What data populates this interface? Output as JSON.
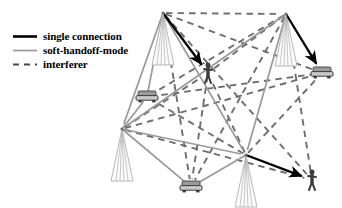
{
  "figure": {
    "background_color": "#ffffff"
  },
  "colors": {
    "single_connection": "#000000",
    "soft_handoff": "#9a9a9a",
    "interferer": "#6e6e6e",
    "tower_outline": "#b0b0b0",
    "mobile_fill": "#5a5a5a",
    "text": "#000000"
  },
  "legend": {
    "items": [
      {
        "label": "single connection",
        "style": "solid-thick",
        "color": "#000000",
        "icon": "solid-line-icon"
      },
      {
        "label": "soft-handoff-mode",
        "style": "solid-thin",
        "color": "#9a9a9a",
        "icon": "solid-line-icon"
      },
      {
        "label": "interferer",
        "style": "dashed",
        "color": "#6e6e6e",
        "icon": "dashed-line-icon"
      }
    ]
  },
  "diagram": {
    "base_stations": [
      {
        "id": "bs-top-left",
        "x": 163,
        "y": 13,
        "name": "base-station-top-left"
      },
      {
        "id": "bs-top-right",
        "x": 286,
        "y": 14,
        "name": "base-station-top-right"
      },
      {
        "id": "bs-left",
        "x": 122,
        "y": 129,
        "name": "base-station-left"
      },
      {
        "id": "bs-bottom",
        "x": 246,
        "y": 155,
        "name": "base-station-bottom"
      }
    ],
    "mobiles": [
      {
        "id": "ms-car-left",
        "x": 147,
        "y": 97,
        "type": "car",
        "name": "mobile-car-left"
      },
      {
        "id": "ms-ped-center",
        "x": 208,
        "y": 73,
        "type": "pedestrian",
        "name": "mobile-pedestrian-center"
      },
      {
        "id": "ms-car-right",
        "x": 322,
        "y": 73,
        "type": "car",
        "name": "mobile-car-right"
      },
      {
        "id": "ms-car-bottom",
        "x": 191,
        "y": 187,
        "type": "car",
        "name": "mobile-car-bottom"
      },
      {
        "id": "ms-ped-bottomright",
        "x": 312,
        "y": 180,
        "type": "pedestrian",
        "name": "mobile-pedestrian-bottom-right"
      }
    ],
    "single_connections": [
      {
        "from": "bs-top-right",
        "to": "ms-car-right",
        "arrow": true
      },
      {
        "from": "bs-bottom",
        "to": "ms-ped-bottomright",
        "arrow": true
      },
      {
        "from": "bs-top-left",
        "to": "ms-ped-center",
        "arrow": true
      }
    ],
    "soft_handoff_links": [
      {
        "from": "bs-top-left",
        "to": "bs-left"
      },
      {
        "from": "bs-top-left",
        "to": "bs-bottom"
      },
      {
        "from": "bs-top-right",
        "to": "bs-left"
      },
      {
        "from": "bs-top-right",
        "to": "bs-bottom"
      },
      {
        "from": "bs-left",
        "to": "bs-bottom"
      },
      {
        "from": "bs-left",
        "to": "ms-car-bottom"
      },
      {
        "from": "bs-bottom",
        "to": "ms-car-bottom"
      },
      {
        "from": "bs-top-left",
        "to": "ms-car-left"
      },
      {
        "from": "bs-left",
        "to": "ms-car-left"
      }
    ],
    "interferer_links": [
      {
        "from": "bs-top-left",
        "to": "bs-top-right"
      },
      {
        "from": "bs-top-left",
        "to": "ms-car-right"
      },
      {
        "from": "bs-top-left",
        "to": "ms-ped-bottomright"
      },
      {
        "from": "bs-top-left",
        "to": "ms-car-bottom"
      },
      {
        "from": "bs-top-right",
        "to": "ms-car-left"
      },
      {
        "from": "bs-top-right",
        "to": "ms-ped-center"
      },
      {
        "from": "bs-top-right",
        "to": "ms-car-bottom"
      },
      {
        "from": "bs-top-right",
        "to": "ms-ped-bottomright"
      },
      {
        "from": "bs-left",
        "to": "ms-ped-center"
      },
      {
        "from": "bs-left",
        "to": "ms-car-right"
      },
      {
        "from": "bs-left",
        "to": "ms-ped-bottomright"
      },
      {
        "from": "bs-bottom",
        "to": "ms-car-left"
      },
      {
        "from": "bs-bottom",
        "to": "ms-ped-center"
      },
      {
        "from": "bs-bottom",
        "to": "ms-car-right"
      },
      {
        "from": "ms-car-left",
        "to": "ms-car-right"
      },
      {
        "from": "ms-ped-center",
        "to": "ms-car-bottom"
      }
    ]
  }
}
